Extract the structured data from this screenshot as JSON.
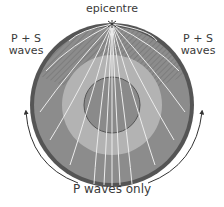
{
  "diagram": {
    "labels": {
      "epicentre": "epicentre",
      "left_zone": "P + S\nwaves",
      "right_zone": "P + S\nwaves",
      "bottom_zone": "P waves only"
    },
    "layers": [
      {
        "name": "crust",
        "color": "#555555"
      },
      {
        "name": "mantle",
        "color": "#8c8c8c"
      },
      {
        "name": "outer-core",
        "color": "#b3b3b3"
      },
      {
        "name": "inner-core",
        "color": "#8a8a8a"
      }
    ],
    "wave_color": "#e8e8e8"
  }
}
